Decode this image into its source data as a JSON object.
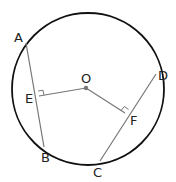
{
  "diagram": {
    "type": "circle-chords-perpendiculars",
    "points": {
      "A": "A",
      "B": "B",
      "C": "C",
      "D": "D",
      "E": "E",
      "F": "F",
      "O": "O"
    },
    "labels": [
      "A",
      "B",
      "C",
      "D",
      "E",
      "F",
      "O"
    ],
    "segments": [
      "AB",
      "CD",
      "OE",
      "OF"
    ],
    "right_angles": [
      "E",
      "F"
    ],
    "colors": {
      "circle": "#111111",
      "chord": "#777777",
      "radius": "#777777",
      "center": "#777777"
    }
  }
}
